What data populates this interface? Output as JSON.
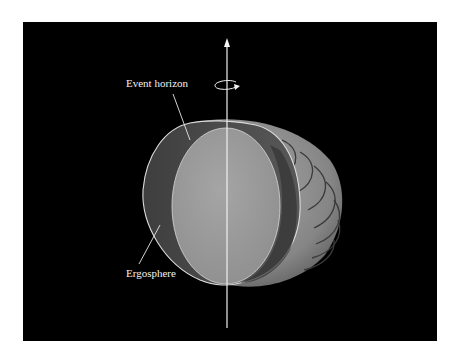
{
  "diagram": {
    "labels": {
      "event_horizon": "Event horizon",
      "ergosphere": "Ergosphere"
    },
    "elements": {
      "rotation_axis": "vertical rotation axis with upward arrow",
      "rotation_indicator": "circular arrow indicating spin direction",
      "outer_surface": "striped ergosphere outer surface",
      "ergosphere_cut_face": "cut-away face of ergosphere",
      "event_horizon_cut_face": "cut-away face of event horizon"
    },
    "colors": {
      "background": "#000000",
      "outer_surface": "#8a8a8a",
      "ergosphere_region": "#4a4a4a",
      "event_horizon_face": "#9a9a9a",
      "lines": "#e6e6e6"
    }
  }
}
